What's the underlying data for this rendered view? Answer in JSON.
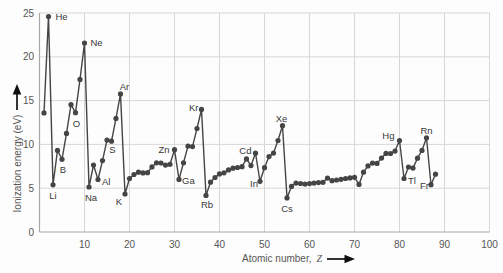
{
  "chart_data": {
    "type": "line",
    "xlabel": "Atomic number, Z",
    "xlabel_parts": {
      "prefix": "Atomic number,",
      "variable": "Z"
    },
    "ylabel": "Ionization energy (eV)",
    "xlim": [
      0,
      100
    ],
    "ylim": [
      0,
      25
    ],
    "x_ticks": [
      10,
      20,
      30,
      40,
      50,
      60,
      70,
      80,
      90,
      100
    ],
    "y_ticks": [
      0,
      5,
      10,
      15,
      20,
      25
    ],
    "grid": true,
    "legend": false,
    "series": [
      {
        "name": "first-ionization-energy",
        "marker": "circle",
        "x": [
          1,
          2,
          3,
          4,
          5,
          6,
          7,
          8,
          9,
          10,
          11,
          12,
          13,
          14,
          15,
          16,
          17,
          18,
          19,
          20,
          21,
          22,
          23,
          24,
          25,
          26,
          27,
          28,
          29,
          30,
          31,
          32,
          33,
          34,
          35,
          36,
          37,
          38,
          39,
          40,
          41,
          42,
          43,
          44,
          45,
          46,
          47,
          48,
          49,
          50,
          51,
          52,
          53,
          54,
          55,
          56,
          57,
          58,
          59,
          60,
          61,
          62,
          63,
          64,
          65,
          66,
          67,
          68,
          69,
          70,
          71,
          72,
          73,
          74,
          75,
          76,
          77,
          78,
          79,
          80,
          81,
          82,
          83,
          84,
          85,
          86,
          87,
          88
        ],
        "symbols": [
          "H",
          "He",
          "Li",
          "Be",
          "B",
          "C",
          "N",
          "O",
          "F",
          "Ne",
          "Na",
          "Mg",
          "Al",
          "Si",
          "P",
          "S",
          "Cl",
          "Ar",
          "K",
          "Ca",
          "Sc",
          "Ti",
          "V",
          "Cr",
          "Mn",
          "Fe",
          "Co",
          "Ni",
          "Cu",
          "Zn",
          "Ga",
          "Ge",
          "As",
          "Se",
          "Br",
          "Kr",
          "Rb",
          "Sr",
          "Y",
          "Zr",
          "Nb",
          "Mo",
          "Tc",
          "Ru",
          "Rh",
          "Pd",
          "Ag",
          "Cd",
          "In",
          "Sn",
          "Sb",
          "Te",
          "I",
          "Xe",
          "Cs",
          "Ba",
          "La",
          "Ce",
          "Pr",
          "Nd",
          "Pm",
          "Sm",
          "Eu",
          "Gd",
          "Tb",
          "Dy",
          "Ho",
          "Er",
          "Tm",
          "Yb",
          "Lu",
          "Hf",
          "Ta",
          "W",
          "Re",
          "Os",
          "Ir",
          "Pt",
          "Au",
          "Hg",
          "Tl",
          "Pb",
          "Bi",
          "Po",
          "At",
          "Rn",
          "Fr",
          "Ra"
        ],
        "values": [
          13.6,
          24.59,
          5.39,
          9.32,
          8.3,
          11.26,
          14.53,
          13.62,
          17.42,
          21.56,
          5.14,
          7.65,
          5.99,
          8.15,
          10.49,
          10.36,
          12.97,
          15.76,
          4.34,
          6.11,
          6.56,
          6.83,
          6.75,
          6.77,
          7.43,
          7.9,
          7.88,
          7.64,
          7.73,
          9.39,
          6.0,
          7.9,
          9.81,
          9.75,
          11.81,
          14.0,
          4.18,
          5.69,
          6.22,
          6.63,
          6.76,
          7.09,
          7.28,
          7.36,
          7.46,
          8.34,
          7.58,
          8.99,
          5.79,
          7.34,
          8.61,
          9.01,
          10.45,
          12.13,
          3.89,
          5.21,
          5.58,
          5.54,
          5.47,
          5.53,
          5.58,
          5.64,
          5.67,
          6.15,
          5.86,
          5.94,
          6.02,
          6.11,
          6.18,
          6.25,
          5.43,
          6.83,
          7.55,
          7.86,
          7.83,
          8.44,
          8.97,
          8.96,
          9.23,
          10.44,
          6.11,
          7.42,
          7.29,
          8.42,
          9.32,
          10.75,
          5.4,
          6.6
        ]
      }
    ],
    "annotations": [
      {
        "z": 2,
        "label": "He",
        "anchor": "start",
        "dx": 7,
        "dy": 3
      },
      {
        "z": 3,
        "label": "Li",
        "anchor": "middle",
        "dx": 0,
        "dy": 14
      },
      {
        "z": 5,
        "label": "B",
        "anchor": "middle",
        "dx": 1,
        "dy": 14
      },
      {
        "z": 8,
        "label": "O",
        "anchor": "middle",
        "dx": 1,
        "dy": 14
      },
      {
        "z": 10,
        "label": "Ne",
        "anchor": "start",
        "dx": 6,
        "dy": 3
      },
      {
        "z": 11,
        "label": "Na",
        "anchor": "middle",
        "dx": 2,
        "dy": 14
      },
      {
        "z": 13,
        "label": "Al",
        "anchor": "start",
        "dx": 4,
        "dy": 5
      },
      {
        "z": 16,
        "label": "S",
        "anchor": "middle",
        "dx": 1,
        "dy": 12
      },
      {
        "z": 18,
        "label": "Ar",
        "anchor": "middle",
        "dx": 4,
        "dy": -4
      },
      {
        "z": 19,
        "label": "K",
        "anchor": "middle",
        "dx": -6,
        "dy": 11
      },
      {
        "z": 30,
        "label": "Zn",
        "anchor": "end",
        "dx": -5,
        "dy": 3
      },
      {
        "z": 31,
        "label": "Ga",
        "anchor": "start",
        "dx": 3,
        "dy": 5
      },
      {
        "z": 36,
        "label": "Kr",
        "anchor": "end",
        "dx": -3,
        "dy": 2
      },
      {
        "z": 37,
        "label": "Rb",
        "anchor": "middle",
        "dx": 1,
        "dy": 13
      },
      {
        "z": 48,
        "label": "Cd",
        "anchor": "end",
        "dx": -4,
        "dy": 1
      },
      {
        "z": 49,
        "label": "In",
        "anchor": "end",
        "dx": -2,
        "dy": 6
      },
      {
        "z": 54,
        "label": "Xe",
        "anchor": "middle",
        "dx": -1,
        "dy": -4
      },
      {
        "z": 55,
        "label": "Cs",
        "anchor": "middle",
        "dx": 0,
        "dy": 14
      },
      {
        "z": 80,
        "label": "Hg",
        "anchor": "end",
        "dx": -5,
        "dy": -2
      },
      {
        "z": 81,
        "label": "Tl",
        "anchor": "start",
        "dx": 4,
        "dy": 5
      },
      {
        "z": 86,
        "label": "Rn",
        "anchor": "middle",
        "dx": 0,
        "dy": -4
      },
      {
        "z": 87,
        "label": "Fr",
        "anchor": "end",
        "dx": -2,
        "dy": 4
      }
    ]
  },
  "colors": {
    "data": "#454545",
    "grid": "#d7d7d7",
    "axis": "#a8a8a8",
    "tick_text": "#565656",
    "annotation_text": "#383838",
    "arrow": "#101010",
    "background": "#fdfdfd"
  }
}
